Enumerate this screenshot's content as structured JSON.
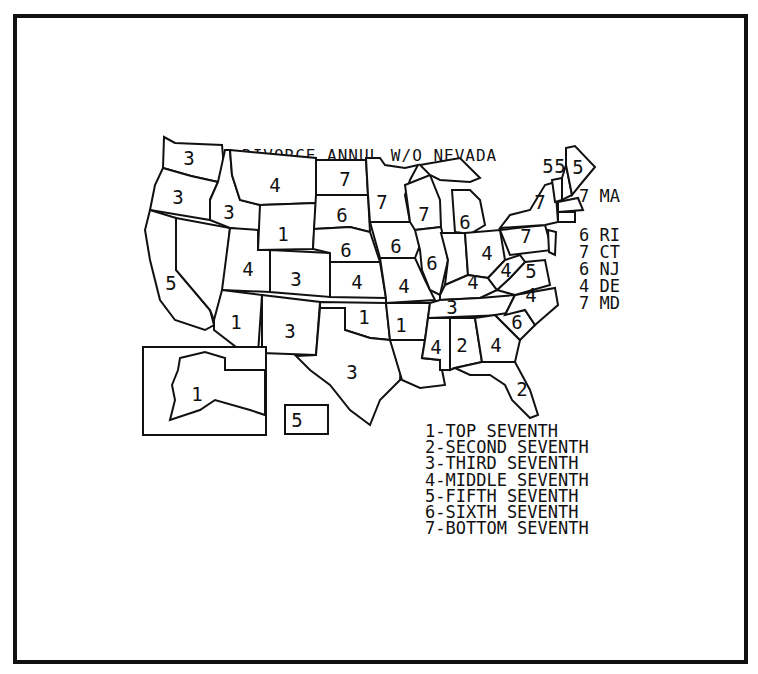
{
  "title": "DIVORCE ANNUL W/O NEVADA",
  "colors": {
    "ink": "#111111",
    "background": "#ffffff"
  },
  "side_labels": [
    {
      "value": "7",
      "state": "MA"
    },
    {
      "value": "6",
      "state": "RI"
    },
    {
      "value": "7",
      "state": "CT"
    },
    {
      "value": "6",
      "state": "NJ"
    },
    {
      "value": "4",
      "state": "DE"
    },
    {
      "value": "7",
      "state": "MD"
    }
  ],
  "legend": [
    "1-TOP SEVENTH",
    "2-SECOND SEVENTH",
    "3-THIRD SEVENTH",
    "4-MIDDLE SEVENTH",
    "5-FIFTH SEVENTH",
    "6-SIXTH SEVENTH",
    "7-BOTTOM SEVENTH"
  ],
  "states": {
    "WA": "3",
    "OR": "3",
    "CA": "5",
    "ID": "3",
    "MT": "4",
    "WY": "1",
    "UT": "4",
    "AZ": "1",
    "CO": "3",
    "NM": "3",
    "ND": "7",
    "SD": "6",
    "NE": "6",
    "KS": "4",
    "OK": "1",
    "TX": "3",
    "MN": "7",
    "IA": "6",
    "MO": "4",
    "AR": "1",
    "LA": "4",
    "WI": "7",
    "IL": "6",
    "MI": "6",
    "IN": "",
    "OH": "4",
    "KY": "4",
    "TN": "3",
    "MS": "4",
    "AL": "2",
    "GA": "4",
    "FL": "2",
    "SC": "6",
    "NC": "4",
    "VA": "5",
    "WV": "4",
    "PA": "7",
    "NY": "7",
    "VT": "5",
    "NH": "5",
    "ME": "5",
    "AK": "1",
    "HI": "5",
    "NV": ""
  }
}
